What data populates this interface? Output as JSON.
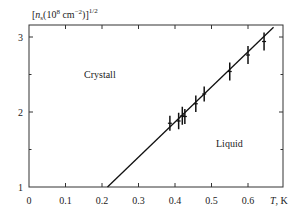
{
  "chart_data": {
    "type": "scatter",
    "title": "",
    "ylabel": "[n_s(10^8 cm^-2)]^1/2",
    "ylabel_parts": {
      "open": "[",
      "n": "n",
      "sub": "s",
      "mid": "(10",
      "exp8": "8",
      "unit": " cm",
      "expm2": "−2",
      "close": ")]",
      "pow": "1/2"
    },
    "xlabel": "T, K",
    "xlabel_parts": {
      "T": "T",
      "unit": ", K"
    },
    "xlim": [
      0,
      0.7
    ],
    "ylim": [
      1,
      3.13
    ],
    "x_ticks": [
      0,
      0.1,
      0.2,
      0.3,
      0.4,
      0.5,
      0.6
    ],
    "x_tick_labels": [
      "0",
      "0.1",
      "0.2",
      "0.3",
      "0.4",
      "0.5",
      "0.6"
    ],
    "y_ticks": [
      1,
      2,
      3
    ],
    "y_tick_labels": [
      "1",
      "2",
      "3"
    ],
    "y_minor_ticks": [
      1.5,
      2.5
    ],
    "grid": false,
    "annotations": [
      {
        "text": "Crystall",
        "x": 0.19,
        "y": 2.5
      },
      {
        "text": "Liquid",
        "x": 0.59,
        "y": 1.59
      }
    ],
    "series": [
      {
        "name": "measured",
        "x": [
          0.386,
          0.41,
          0.42,
          0.427,
          0.457,
          0.48,
          0.55,
          0.6,
          0.644
        ],
        "y": [
          1.85,
          1.88,
          1.95,
          1.94,
          2.11,
          2.24,
          2.54,
          2.76,
          2.94
        ],
        "yerr": [
          0.1,
          0.11,
          0.12,
          0.1,
          0.11,
          0.1,
          0.12,
          0.12,
          0.12
        ]
      },
      {
        "name": "melting line",
        "type": "line",
        "x": [
          0.215,
          0.67
        ],
        "y": [
          1.0,
          3.13
        ]
      }
    ]
  }
}
